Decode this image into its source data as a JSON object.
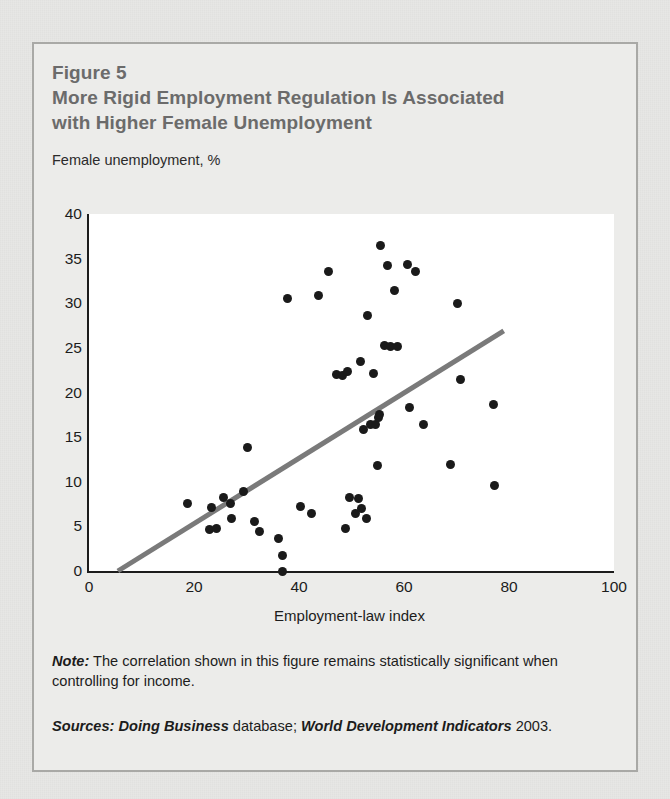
{
  "figure": {
    "label": "Figure 5",
    "title_line1": "More Rigid Employment Regulation Is Associated",
    "title_line2": "with Higher Female Unemployment",
    "note_prefix": "Note:",
    "note_text": " The correlation shown in this figure remains statistically significant when controlling for income.",
    "sources_prefix": "Sources:",
    "sources_italic1": " Doing Business",
    "sources_mid": " database; ",
    "sources_italic2": "World Development Indicators",
    "sources_tail": " 2003.",
    "border_color": "#a9a9a6",
    "title_color": "#6b6b6b",
    "page_background": "#e7e7e5"
  },
  "chart_data": {
    "type": "scatter",
    "title": "More Rigid Employment Regulation Is Associated with Higher Female Unemployment",
    "xlabel": "Employment-law index",
    "ylabel": "Female unemployment, %",
    "ylabel_position": "above-axis",
    "xlim": [
      0,
      100
    ],
    "ylim": [
      0,
      40
    ],
    "xticks": [
      0,
      20,
      40,
      60,
      80,
      100
    ],
    "yticks": [
      0,
      5,
      10,
      15,
      20,
      25,
      30,
      35,
      40
    ],
    "grid": false,
    "legend": "none",
    "point_color": "#1a1a1a",
    "point_size_px": 9,
    "trendline": {
      "type": "linear-fit",
      "color": "#7a7a7a",
      "width_px": 5,
      "x_start": 5.5,
      "y_start": 0.0,
      "x_end": 79.0,
      "y_end": 26.9
    },
    "points": [
      {
        "x": 18.8,
        "y": 7.6
      },
      {
        "x": 22.9,
        "y": 4.6
      },
      {
        "x": 23.4,
        "y": 7.1
      },
      {
        "x": 24.3,
        "y": 4.8
      },
      {
        "x": 25.6,
        "y": 8.2
      },
      {
        "x": 26.9,
        "y": 7.6
      },
      {
        "x": 27.2,
        "y": 5.9
      },
      {
        "x": 29.5,
        "y": 8.9
      },
      {
        "x": 30.2,
        "y": 13.8
      },
      {
        "x": 31.5,
        "y": 5.6
      },
      {
        "x": 32.5,
        "y": 4.4
      },
      {
        "x": 36.0,
        "y": 3.6
      },
      {
        "x": 36.8,
        "y": 1.7
      },
      {
        "x": 36.8,
        "y": 0.0
      },
      {
        "x": 37.9,
        "y": 30.5
      },
      {
        "x": 40.3,
        "y": 7.2
      },
      {
        "x": 42.4,
        "y": 6.4
      },
      {
        "x": 43.8,
        "y": 30.9
      },
      {
        "x": 45.6,
        "y": 33.6
      },
      {
        "x": 47.2,
        "y": 22.0
      },
      {
        "x": 48.3,
        "y": 21.9
      },
      {
        "x": 48.8,
        "y": 4.8
      },
      {
        "x": 49.3,
        "y": 22.4
      },
      {
        "x": 49.6,
        "y": 8.2
      },
      {
        "x": 50.8,
        "y": 6.4
      },
      {
        "x": 51.4,
        "y": 8.1
      },
      {
        "x": 51.7,
        "y": 23.5
      },
      {
        "x": 51.9,
        "y": 7.0
      },
      {
        "x": 52.3,
        "y": 15.8
      },
      {
        "x": 52.8,
        "y": 5.9
      },
      {
        "x": 53.1,
        "y": 28.6
      },
      {
        "x": 53.6,
        "y": 16.4
      },
      {
        "x": 54.2,
        "y": 22.1
      },
      {
        "x": 54.5,
        "y": 16.4
      },
      {
        "x": 54.9,
        "y": 11.8
      },
      {
        "x": 55.2,
        "y": 17.2
      },
      {
        "x": 55.4,
        "y": 17.5
      },
      {
        "x": 55.6,
        "y": 36.5
      },
      {
        "x": 56.3,
        "y": 25.3
      },
      {
        "x": 56.9,
        "y": 34.2
      },
      {
        "x": 57.4,
        "y": 25.2
      },
      {
        "x": 58.1,
        "y": 31.4
      },
      {
        "x": 58.8,
        "y": 25.2
      },
      {
        "x": 60.6,
        "y": 34.3
      },
      {
        "x": 61.0,
        "y": 18.3
      },
      {
        "x": 62.1,
        "y": 33.6
      },
      {
        "x": 63.8,
        "y": 16.4
      },
      {
        "x": 68.9,
        "y": 11.9
      },
      {
        "x": 70.2,
        "y": 30.0
      },
      {
        "x": 70.7,
        "y": 21.5
      },
      {
        "x": 77.0,
        "y": 18.7
      },
      {
        "x": 77.3,
        "y": 9.6
      }
    ]
  }
}
